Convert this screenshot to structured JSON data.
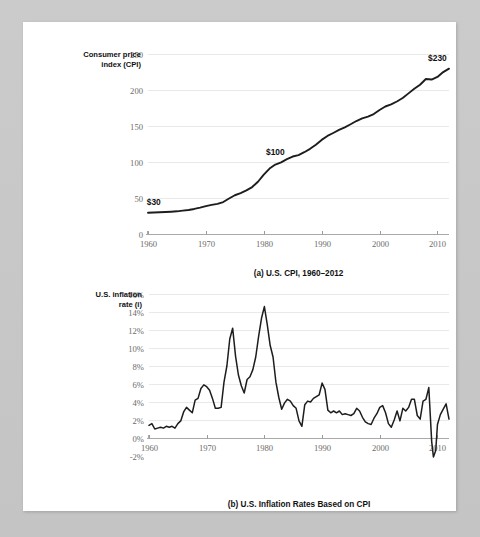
{
  "page": {
    "background_color": "#ffffff",
    "frame_color": "#c9c9c9"
  },
  "figures": [
    {
      "id": "figure-a",
      "caption": "(a) U.S. CPI, 1960–2012",
      "axis_title_line1": "Consumer price",
      "axis_title_line2": "index (CPI)",
      "y_ticks": [
        "250",
        "200",
        "150",
        "100",
        "50",
        "0"
      ],
      "x_ticks": [
        "1960",
        "1970",
        "1980",
        "1990",
        "2000",
        "2010"
      ],
      "annotations": [
        {
          "label": "$30",
          "x_year": 1961,
          "y_value": 30
        },
        {
          "label": "$100",
          "x_year": 1982,
          "y_value": 100
        },
        {
          "label": "$230",
          "x_year": 2010,
          "y_value": 230
        }
      ]
    },
    {
      "id": "figure-b",
      "caption": "(b) U.S. Inflation Rates Based on CPI",
      "axis_title_line1": "U.S. inflation",
      "axis_title_line2": "rate (i)",
      "y_ticks": [
        "16%",
        "14%",
        "12%",
        "10%",
        "8%",
        "6%",
        "4%",
        "2%",
        "0%",
        "-2%"
      ],
      "x_ticks": [
        "1960",
        "1970",
        "1980",
        "1990",
        "2000",
        "2010"
      ],
      "annotations": []
    }
  ],
  "chart_data": [
    {
      "type": "line",
      "title": "(a) U.S. CPI, 1960–2012",
      "xlabel": "",
      "ylabel": "Consumer price index (CPI)",
      "xlim": [
        1960,
        2012
      ],
      "ylim": [
        0,
        250
      ],
      "grid": true,
      "legend": "none",
      "x": [
        1960,
        1961,
        1962,
        1963,
        1964,
        1965,
        1966,
        1967,
        1968,
        1969,
        1970,
        1971,
        1972,
        1973,
        1974,
        1975,
        1976,
        1977,
        1978,
        1979,
        1980,
        1981,
        1982,
        1983,
        1984,
        1985,
        1986,
        1987,
        1988,
        1989,
        1990,
        1991,
        1992,
        1993,
        1994,
        1995,
        1996,
        1997,
        1998,
        1999,
        2000,
        2001,
        2002,
        2003,
        2004,
        2005,
        2006,
        2007,
        2008,
        2009,
        2010,
        2011,
        2012
      ],
      "values": [
        29.6,
        29.9,
        30.2,
        30.6,
        31.0,
        31.5,
        32.4,
        33.4,
        34.8,
        36.7,
        38.8,
        40.5,
        41.8,
        44.4,
        49.3,
        53.8,
        56.9,
        60.6,
        65.2,
        72.6,
        82.4,
        90.9,
        96.5,
        99.6,
        103.9,
        107.6,
        109.6,
        113.6,
        118.3,
        124.0,
        130.7,
        136.2,
        140.3,
        144.5,
        148.2,
        152.4,
        156.9,
        160.5,
        163.0,
        166.6,
        172.2,
        177.1,
        179.9,
        184.0,
        188.9,
        195.3,
        201.6,
        207.3,
        215.3,
        214.5,
        218.1,
        224.9,
        229.6
      ],
      "annotations": [
        {
          "label": "$30",
          "x": 1961,
          "y": 30
        },
        {
          "label": "$100",
          "x": 1982,
          "y": 100
        },
        {
          "label": "$230",
          "x": 2010,
          "y": 230
        }
      ]
    },
    {
      "type": "line",
      "title": "(b) U.S. Inflation Rates Based on CPI",
      "xlabel": "",
      "ylabel": "U.S. inflation rate (i)",
      "xlim": [
        1960,
        2012
      ],
      "ylim": [
        -2,
        16
      ],
      "grid": true,
      "legend": "none",
      "x": [
        1960.0,
        1960.5,
        1961.0,
        1961.5,
        1962.0,
        1962.5,
        1963.0,
        1963.5,
        1964.0,
        1964.5,
        1965.0,
        1965.5,
        1966.0,
        1966.5,
        1967.0,
        1967.5,
        1968.0,
        1968.5,
        1969.0,
        1969.5,
        1970.0,
        1970.5,
        1971.0,
        1971.5,
        1972.0,
        1972.5,
        1973.0,
        1973.5,
        1974.0,
        1974.5,
        1975.0,
        1975.5,
        1976.0,
        1976.5,
        1977.0,
        1977.5,
        1978.0,
        1978.5,
        1979.0,
        1979.5,
        1980.0,
        1980.5,
        1981.0,
        1981.5,
        1982.0,
        1982.5,
        1983.0,
        1983.5,
        1984.0,
        1984.5,
        1985.0,
        1985.5,
        1986.0,
        1986.5,
        1987.0,
        1987.5,
        1988.0,
        1988.5,
        1989.0,
        1989.5,
        1990.0,
        1990.5,
        1991.0,
        1991.5,
        1992.0,
        1992.5,
        1993.0,
        1993.5,
        1994.0,
        1994.5,
        1995.0,
        1995.5,
        1996.0,
        1996.5,
        1997.0,
        1997.5,
        1998.0,
        1998.5,
        1999.0,
        1999.5,
        2000.0,
        2000.5,
        2001.0,
        2001.5,
        2002.0,
        2002.5,
        2003.0,
        2003.5,
        2004.0,
        2004.5,
        2005.0,
        2005.5,
        2006.0,
        2006.5,
        2007.0,
        2007.5,
        2008.0,
        2008.5,
        2009.0,
        2009.3,
        2009.7,
        2010.0,
        2010.5,
        2011.0,
        2011.5,
        2012.0
      ],
      "values": [
        1.4,
        1.6,
        1.0,
        1.1,
        1.2,
        1.1,
        1.3,
        1.2,
        1.3,
        1.1,
        1.6,
        1.9,
        2.9,
        3.4,
        3.1,
        2.8,
        4.2,
        4.4,
        5.5,
        5.9,
        5.7,
        5.3,
        4.4,
        3.3,
        3.3,
        3.4,
        6.2,
        8.0,
        11.0,
        12.2,
        9.1,
        7.0,
        5.8,
        5.0,
        6.5,
        6.8,
        7.6,
        9.0,
        11.3,
        13.3,
        14.6,
        12.6,
        10.3,
        9.0,
        6.2,
        4.5,
        3.2,
        3.9,
        4.3,
        4.1,
        3.6,
        3.3,
        1.9,
        1.3,
        3.7,
        4.1,
        4.0,
        4.4,
        4.6,
        4.8,
        6.1,
        5.4,
        3.1,
        2.8,
        3.0,
        2.8,
        3.0,
        2.6,
        2.7,
        2.6,
        2.5,
        2.7,
        3.3,
        3.0,
        2.3,
        1.8,
        1.6,
        1.5,
        2.2,
        2.7,
        3.4,
        3.6,
        2.8,
        1.6,
        1.2,
        2.0,
        3.0,
        1.9,
        3.3,
        3.0,
        3.4,
        4.3,
        4.3,
        2.5,
        2.1,
        4.1,
        4.3,
        5.6,
        -0.4,
        -2.1,
        -1.4,
        1.5,
        2.6,
        3.2,
        3.8,
        2.1
      ]
    }
  ]
}
